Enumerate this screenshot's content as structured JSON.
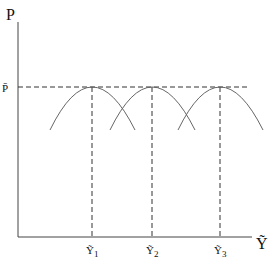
{
  "labels": {
    "y_axis": "P",
    "x_axis": "Ỹ",
    "p_bar": "P̄",
    "y1": "Ỹ",
    "y1_sub": "1",
    "y2": "Ỹ",
    "y2_sub": "2",
    "y3": "Ỹ",
    "y3_sub": "3"
  },
  "colors": {
    "line": "#333333",
    "curve": "#666666"
  }
}
